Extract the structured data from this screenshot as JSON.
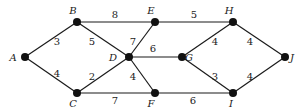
{
  "diagram": {
    "type": "weighted-undirected-graph",
    "nodes": [
      {
        "id": "A",
        "label": "A",
        "x": 25,
        "y": 57,
        "lx": 13,
        "ly": 61
      },
      {
        "id": "B",
        "label": "B",
        "x": 77,
        "y": 22,
        "lx": 73,
        "ly": 14
      },
      {
        "id": "C",
        "label": "C",
        "x": 77,
        "y": 93,
        "lx": 73,
        "ly": 107
      },
      {
        "id": "D",
        "label": "D",
        "x": 129,
        "y": 57,
        "lx": 113,
        "ly": 61
      },
      {
        "id": "E",
        "label": "E",
        "x": 155,
        "y": 22,
        "lx": 151,
        "ly": 14
      },
      {
        "id": "F",
        "label": "F",
        "x": 155,
        "y": 93,
        "lx": 151,
        "ly": 107
      },
      {
        "id": "G",
        "label": "G",
        "x": 182,
        "y": 57,
        "lx": 189,
        "ly": 61
      },
      {
        "id": "H",
        "label": "H",
        "x": 233,
        "y": 22,
        "lx": 229,
        "ly": 14
      },
      {
        "id": "I",
        "label": "I",
        "x": 233,
        "y": 93,
        "lx": 231,
        "ly": 107
      },
      {
        "id": "J",
        "label": "J",
        "x": 285,
        "y": 57,
        "lx": 292,
        "ly": 61
      }
    ],
    "edges": [
      {
        "from": "A",
        "to": "B",
        "weight": "3",
        "wx": 57,
        "wy": 45
      },
      {
        "from": "A",
        "to": "C",
        "weight": "4",
        "wx": 57,
        "wy": 77
      },
      {
        "from": "B",
        "to": "E",
        "weight": "8",
        "wx": 115,
        "wy": 18
      },
      {
        "from": "B",
        "to": "D",
        "weight": "5",
        "wx": 92,
        "wy": 45
      },
      {
        "from": "C",
        "to": "D",
        "weight": "2",
        "wx": 92,
        "wy": 80
      },
      {
        "from": "C",
        "to": "F",
        "weight": "7",
        "wx": 115,
        "wy": 104
      },
      {
        "from": "D",
        "to": "E",
        "weight": "7",
        "wx": 133,
        "wy": 45
      },
      {
        "from": "D",
        "to": "G",
        "weight": "6",
        "wx": 153,
        "wy": 52
      },
      {
        "from": "D",
        "to": "F",
        "weight": "4",
        "wx": 133,
        "wy": 80
      },
      {
        "from": "E",
        "to": "H",
        "weight": "5",
        "wx": 194,
        "wy": 18
      },
      {
        "from": "F",
        "to": "I",
        "weight": "6",
        "wx": 193,
        "wy": 104
      },
      {
        "from": "G",
        "to": "H",
        "weight": "4",
        "wx": 215,
        "wy": 45
      },
      {
        "from": "G",
        "to": "I",
        "weight": "3",
        "wx": 215,
        "wy": 80
      },
      {
        "from": "H",
        "to": "J",
        "weight": "4",
        "wx": 250,
        "wy": 45
      },
      {
        "from": "I",
        "to": "J",
        "weight": "4",
        "wx": 250,
        "wy": 80
      }
    ]
  }
}
